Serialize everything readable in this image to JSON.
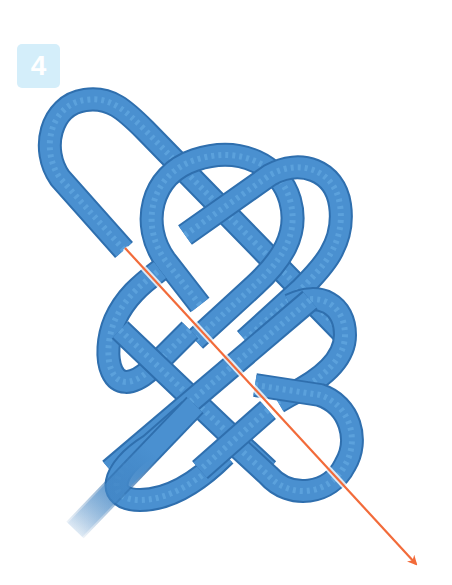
{
  "step": {
    "number": "4",
    "badge_color": "#d4eefa",
    "number_color": "#ffffff"
  },
  "illustration": {
    "subject": "decorative rope knot (pretzel / Josephine-style knot), step 4",
    "rope_color": "#4a90d0",
    "rope_outline_color": "#2f6fae",
    "arrow": {
      "color": "#f26b3a",
      "from": [
        125,
        248
      ],
      "to": [
        420,
        570
      ],
      "meaning": "direction to pass the working end through the knot"
    }
  }
}
